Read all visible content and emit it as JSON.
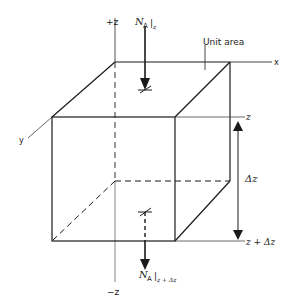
{
  "diagram": {
    "type": "control-volume-cube",
    "axes": {
      "plus_z": "+z",
      "minus_z": "−z",
      "x": "x",
      "y": "y"
    },
    "labels": {
      "unit_area": "Unit area",
      "flux_top_main": "N",
      "flux_top_sub": "A",
      "flux_top_eval": "|",
      "flux_top_at": "z",
      "flux_bottom_main": "N",
      "flux_bottom_sub": "A",
      "flux_bottom_eval": "|",
      "flux_bottom_at": "z + Δz",
      "level_top": "z",
      "level_bottom": "z + Δz",
      "thickness": "Δz"
    },
    "colors": {
      "line": "#1a1a1a",
      "background": "#ffffff"
    }
  }
}
